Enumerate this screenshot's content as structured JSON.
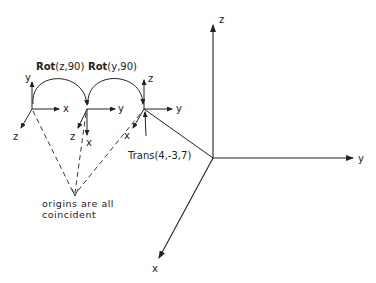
{
  "diagram": {
    "type": "coordinate-frame-transformation",
    "ops": {
      "rot_z": {
        "prefix": "Rot",
        "args": "(z,90)"
      },
      "rot_y": {
        "prefix": "Rot",
        "args": "(y,90)"
      },
      "trans": "Trans(4,-3,7)"
    },
    "frames": [
      {
        "id": "frame-1",
        "axes": {
          "up": "y",
          "right": "x",
          "diag": "z"
        }
      },
      {
        "id": "frame-2",
        "axes": {
          "right": "y",
          "down": "x",
          "diag": "z"
        }
      },
      {
        "id": "frame-3",
        "axes": {
          "up": "z",
          "right": "y",
          "diag": "x"
        }
      }
    ],
    "world_frame": {
      "axes": {
        "up": "z",
        "right": "y",
        "diag": "x"
      }
    },
    "note": {
      "line1": "origins are all",
      "line2": "coincident"
    }
  }
}
